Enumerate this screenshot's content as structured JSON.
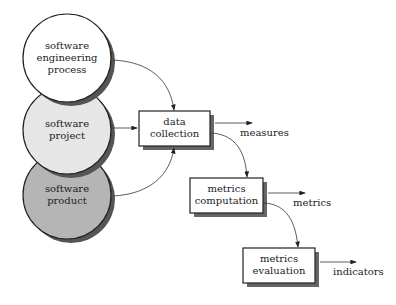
{
  "diagram": {
    "sources": [
      {
        "id": "process",
        "label_lines": [
          "software",
          "engineering",
          "process"
        ],
        "fill": "#ffffff"
      },
      {
        "id": "project",
        "label_lines": [
          "software",
          "project"
        ],
        "fill": "#e6e6e6"
      },
      {
        "id": "product",
        "label_lines": [
          "software",
          "product"
        ],
        "fill": "#b5b5b5"
      }
    ],
    "steps": [
      {
        "id": "data-collection",
        "label_lines": [
          "data",
          "collection"
        ],
        "output": "measures"
      },
      {
        "id": "metrics-computation",
        "label_lines": [
          "metrics",
          "computation"
        ],
        "output": "metrics"
      },
      {
        "id": "metrics-evaluation",
        "label_lines": [
          "metrics",
          "evaluation"
        ],
        "output": "indicators"
      }
    ]
  }
}
